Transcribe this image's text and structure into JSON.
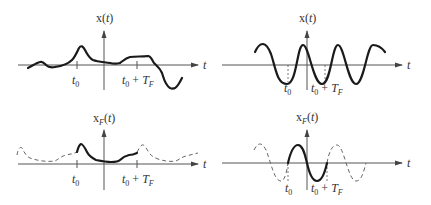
{
  "panels": [
    {
      "id": "top-left",
      "y_label": "x(t)",
      "x_label": "t",
      "tick_labels": [
        "t0",
        "t0 + TF"
      ],
      "description": "Arbitrary aperiodic signal x(t)"
    },
    {
      "id": "top-right",
      "y_label": "x(t)",
      "x_label": "t",
      "tick_labels": [
        "t0",
        "t0 + TF"
      ],
      "description": "Sinusoidal signal x(t)"
    },
    {
      "id": "bottom-left",
      "y_label": "xF(t)",
      "x_label": "t",
      "tick_labels": [
        "t0",
        "t0 + TF"
      ],
      "description": "Periodic extension xF(t) of x(t) over interval t0 to t0+TF"
    },
    {
      "id": "bottom-right",
      "y_label": "xF(t)",
      "x_label": "t",
      "tick_labels": [
        "t0",
        "t0 + TF"
      ],
      "description": "Periodic extension xF(t) of sinusoid over interval t0 to t0+TF"
    }
  ],
  "labels": {
    "x_of_t": "x(",
    "t": "t",
    "close": ")",
    "x": "x",
    "F": "F",
    "t0_t": "t",
    "t0_sub": "0",
    "plus": " + ",
    "T": "T",
    "TF_sub": "F"
  }
}
